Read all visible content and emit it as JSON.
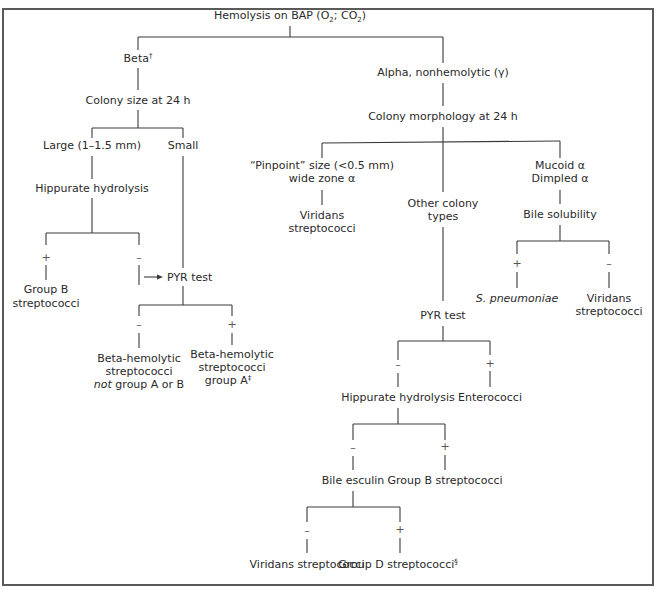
{
  "colors": {
    "line": "#3a3a3a",
    "text": "#2a2a2a",
    "frame": "#5a5a5a"
  },
  "nodes": {
    "root": {
      "prefix": "Hemolysis on BAP (O",
      "sub1": "2",
      "mid": "; CO",
      "sub2": "2",
      "suffix": ")"
    },
    "beta": {
      "label": "Beta",
      "mark": "†"
    },
    "colony_size": {
      "label": "Colony size at 24 h"
    },
    "large": {
      "label": "Large (1–1.5 mm)"
    },
    "small": {
      "label": "Small"
    },
    "hippurate_left": {
      "label": "Hippurate hydrolysis"
    },
    "group_b_left": {
      "line1": "Group B",
      "line2": "streptococci"
    },
    "pyr_left": {
      "label": "PYR test"
    },
    "beta_not_ab": {
      "line1": "Beta-hemolytic",
      "line2": "streptococci",
      "line3_italic": "not",
      "line3_rest": " group A or B"
    },
    "beta_group_a": {
      "line1": "Beta-hemolytic",
      "line2": "streptococci",
      "line3": "group A",
      "mark": "‡"
    },
    "alpha": {
      "label": "Alpha, nonhemolytic (γ)"
    },
    "colony_morph": {
      "label": "Colony morphology at 24 h"
    },
    "pinpoint": {
      "line1": "“Pinpoint” size (<0.5 mm)",
      "line2": "wide zone α"
    },
    "viridans_pinpoint": {
      "line1": "Viridans",
      "line2": "streptococci"
    },
    "other_types": {
      "line1": "Other colony",
      "line2": "types"
    },
    "mucoid": {
      "line1": "Mucoid α",
      "line2": "Dimpled α"
    },
    "bile_solubility": {
      "label": "Bile solubility"
    },
    "s_pneumoniae": {
      "label": "S. pneumoniae"
    },
    "viridans_bile": {
      "line1": "Viridans",
      "line2": "streptococci"
    },
    "pyr_right": {
      "label": "PYR test"
    },
    "hippurate_right": {
      "label": "Hippurate hydrolysis"
    },
    "enterococci": {
      "label": "Enterococci"
    },
    "bile_esculin": {
      "label": "Bile esculin"
    },
    "group_b_right": {
      "label": "Group B streptococci"
    },
    "viridans_final": {
      "label": "Viridans streptococci"
    },
    "group_d": {
      "label": "Group D streptococci",
      "mark": "§"
    }
  },
  "signs": {
    "plus": "+",
    "minus": "–"
  }
}
